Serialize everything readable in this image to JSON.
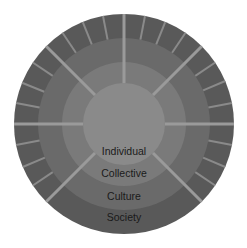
{
  "diagram": {
    "type": "concentric-rings",
    "center": [
      124,
      124
    ],
    "rings": [
      {
        "id": "society",
        "label": "Society",
        "outer_radius": 110,
        "inner_radius": 86,
        "color": "#595959",
        "label_y": 221
      },
      {
        "id": "culture",
        "label": "Culture",
        "outer_radius": 86,
        "inner_radius": 62,
        "color": "#6a6a6a",
        "label_y": 200
      },
      {
        "id": "collective",
        "label": "Collective",
        "outer_radius": 62,
        "inner_radius": 41,
        "color": "#7a7a7a",
        "label_y": 177
      },
      {
        "id": "individual",
        "label": "Individual",
        "outer_radius": 41,
        "inner_radius": 0,
        "color": "#8a8a8a",
        "label_y": 155
      }
    ],
    "major_dividers": {
      "angles_deg": [
        0,
        45,
        90,
        135,
        180,
        225,
        315
      ],
      "from_radius": 41,
      "to_radius": 110,
      "color": "#9a9a9a",
      "width": 3
    },
    "minor_dividers": {
      "angles_deg": [
        11,
        23,
        34,
        56,
        68,
        79,
        101,
        112,
        124,
        146,
        158,
        169,
        191,
        203,
        214,
        326,
        337,
        349
      ],
      "from_radius": 86,
      "to_radius": 110,
      "color": "#8a8a8a",
      "width": 2
    },
    "labels": [
      "Individual",
      "Collective",
      "Culture",
      "Society"
    ]
  }
}
